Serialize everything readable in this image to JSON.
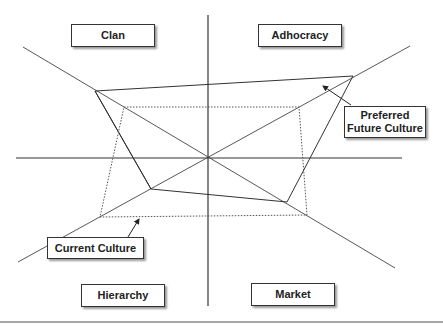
{
  "diagram": {
    "type": "competing-values-framework",
    "quadrants": {
      "top_left": "Clan",
      "top_right": "Adhocracy",
      "bottom_left": "Hierarchy",
      "bottom_right": "Market"
    },
    "callouts": {
      "preferred": "Preferred Future Culture",
      "preferred_line1": "Preferred",
      "preferred_line2": "Future Culture",
      "current": "Current Culture"
    },
    "center": [
      208,
      157
    ],
    "profiles": [
      {
        "name": "Preferred Future Culture",
        "style": "solid",
        "points": {
          "Clan": [
            95,
            91
          ],
          "Adhocracy": [
            353,
            76
          ],
          "Market": [
            287,
            202
          ],
          "Hierarchy": [
            151,
            189
          ]
        }
      },
      {
        "name": "Current Culture",
        "style": "dotted",
        "points": {
          "Clan": [
            124,
            107
          ],
          "Adhocracy": [
            299,
            107
          ],
          "Market": [
            307,
            215
          ],
          "Hierarchy": [
            100,
            217
          ]
        }
      }
    ]
  }
}
